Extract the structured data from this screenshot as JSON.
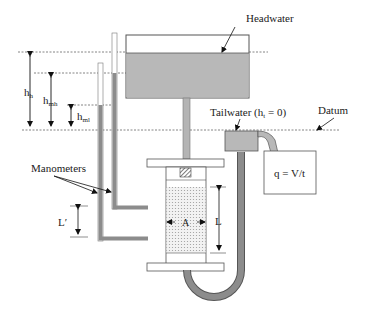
{
  "diagram": {
    "labels": {
      "headwater": "Headwater",
      "tailwater": "Tailwater (h",
      "tailwater_sub": "t",
      "tailwater_tail": " = 0)",
      "datum": "Datum",
      "manometers": "Manometers",
      "flow_formula": "q = V/t",
      "h_h_base": "h",
      "h_h_sub": "h",
      "h_mh_base": "h",
      "h_mh_sub": "mh",
      "h_ml_base": "h",
      "h_ml_sub": "ml",
      "L_prime": "L′",
      "L": "L",
      "A": "A"
    },
    "colors": {
      "water": "#b4b4b4",
      "pipe": "#8c8c8c",
      "outline": "#555555",
      "soil_dot": "#9a9a9a",
      "dashed": "#666666"
    }
  }
}
